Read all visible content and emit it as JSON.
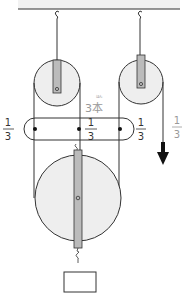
{
  "diagram": {
    "type": "pulley-system",
    "label_ropes": "3本",
    "label_ropes_ruby": "ほん",
    "fractions": [
      {
        "name": "left",
        "numerator": "1",
        "denominator": "3"
      },
      {
        "name": "middle",
        "numerator": "1",
        "denominator": "3"
      },
      {
        "name": "right",
        "numerator": "1",
        "denominator": "3"
      },
      {
        "name": "pull",
        "numerator": "1",
        "denominator": "3"
      }
    ],
    "colors": {
      "line": "#333333",
      "pulley_fill": "#eeeeee",
      "ceiling_fill": "#f2f2f2",
      "axle_fill": "#bbbbbb",
      "label_gray": "#999999",
      "arrow": "#111111"
    }
  }
}
